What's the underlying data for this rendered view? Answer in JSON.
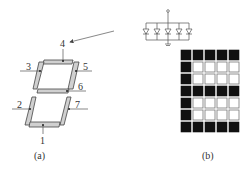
{
  "figure": {
    "panel_a": {
      "caption": "(a)",
      "segment_labels": [
        "1",
        "2",
        "3",
        "4",
        "5",
        "6",
        "7"
      ]
    },
    "panel_b": {
      "caption": "(b)",
      "matrix": {
        "rows": 7,
        "cols": 5,
        "pattern": [
          [
            1,
            1,
            1,
            1,
            1
          ],
          [
            1,
            0,
            0,
            0,
            0
          ],
          [
            1,
            0,
            0,
            0,
            0
          ],
          [
            1,
            1,
            1,
            1,
            1
          ],
          [
            1,
            0,
            0,
            0,
            0
          ],
          [
            1,
            0,
            0,
            0,
            0
          ],
          [
            1,
            1,
            1,
            1,
            1
          ]
        ]
      }
    },
    "led_array": {
      "count": 5
    }
  }
}
